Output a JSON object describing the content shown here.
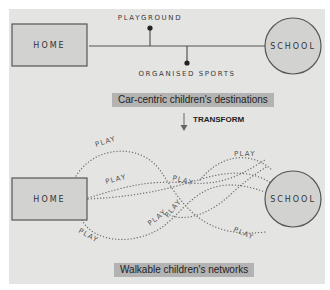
{
  "top_diagram": {
    "home_label": "HOME",
    "school_label": "SCHOOL",
    "branch_top_label": "PLAYGROUND",
    "branch_bottom_label": "ORGANISED SPORTS",
    "caption": "Car-centric children's destinations"
  },
  "transition": {
    "label": "TRANSFORM",
    "arrow_icon": "down-arrow-icon"
  },
  "bottom_diagram": {
    "home_label": "HOME",
    "school_label": "SCHOOL",
    "path_labels": [
      "PLAY",
      "PLAY",
      "PLAY",
      "PLAY",
      "PLAY",
      "PLAY",
      "PLAY",
      "PLAY"
    ],
    "caption": "Walkable children's networks"
  },
  "colors": {
    "panel_bg": "#e4e4e3",
    "shape_fill": "#d2d2d1",
    "stroke": "#555555",
    "caption_bg": "#b3b3b3",
    "dotted_path": "#6a6a6a"
  }
}
